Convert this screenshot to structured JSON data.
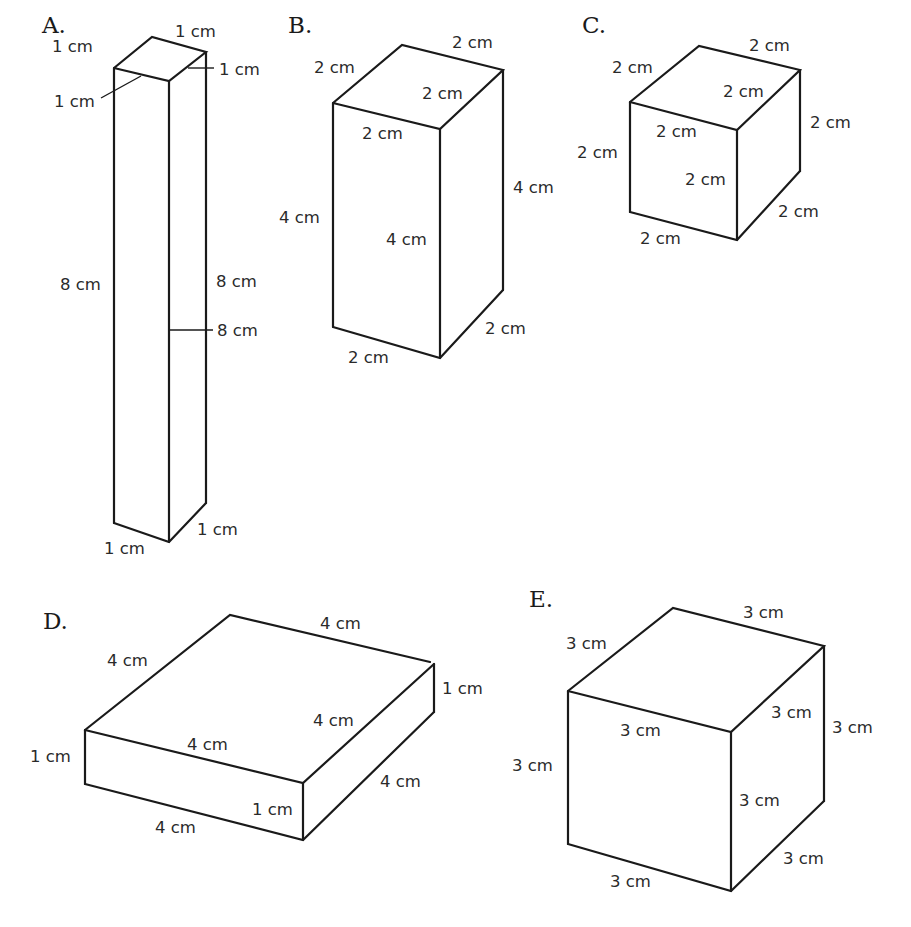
{
  "figures": [
    {
      "id": "A",
      "label": "A.",
      "dimensions": {
        "length_cm": 1,
        "width_cm": 1,
        "height_cm": 8
      },
      "edge_labels": {
        "top_back_left": "1 cm",
        "top_back_right": "1 cm",
        "top_front_right": "1 cm",
        "top_front_left": "1 cm",
        "left_vertical": "8 cm",
        "right_vertical": "8 cm",
        "front_vertical": "8 cm",
        "bottom_front_left": "1 cm",
        "bottom_front_right": "1 cm"
      }
    },
    {
      "id": "B",
      "label": "B.",
      "dimensions": {
        "length_cm": 2,
        "width_cm": 2,
        "height_cm": 4
      },
      "edge_labels": {
        "top_back_left": "2 cm",
        "top_back_right": "2 cm",
        "top_front_right": "2 cm",
        "top_front_left": "2 cm",
        "left_vertical": "4 cm",
        "front_vertical": "4 cm",
        "right_vertical": "4 cm",
        "bottom_front_left": "2 cm",
        "bottom_front_right": "2 cm"
      }
    },
    {
      "id": "C",
      "label": "C.",
      "dimensions": {
        "length_cm": 2,
        "width_cm": 2,
        "height_cm": 2
      },
      "edge_labels": {
        "top_back_left": "2 cm",
        "top_back_right": "2 cm",
        "top_front_right": "2 cm",
        "top_front_left": "2 cm",
        "left_vertical": "2 cm",
        "front_vertical": "2 cm",
        "right_vertical": "2 cm",
        "bottom_front_left": "2 cm",
        "bottom_front_right": "2 cm"
      }
    },
    {
      "id": "D",
      "label": "D.",
      "dimensions": {
        "length_cm": 4,
        "width_cm": 4,
        "height_cm": 1
      },
      "edge_labels": {
        "top_back_left": "4 cm",
        "top_back_right": "4 cm",
        "top_front_right": "4 cm",
        "top_front_left": "4 cm",
        "left_vertical": "1 cm",
        "front_vertical": "1 cm",
        "right_vertical": "1 cm",
        "bottom_front_left": "4 cm",
        "bottom_front_right": "4 cm"
      }
    },
    {
      "id": "E",
      "label": "E.",
      "dimensions": {
        "length_cm": 3,
        "width_cm": 3,
        "height_cm": 3
      },
      "edge_labels": {
        "top_back_left": "3 cm",
        "top_back_right": "3 cm",
        "top_front_right": "3 cm",
        "top_front_left": "3 cm",
        "left_vertical": "3 cm",
        "front_vertical": "3 cm",
        "right_vertical": "3 cm",
        "bottom_front_left": "3 cm",
        "bottom_front_right": "3 cm"
      }
    }
  ]
}
